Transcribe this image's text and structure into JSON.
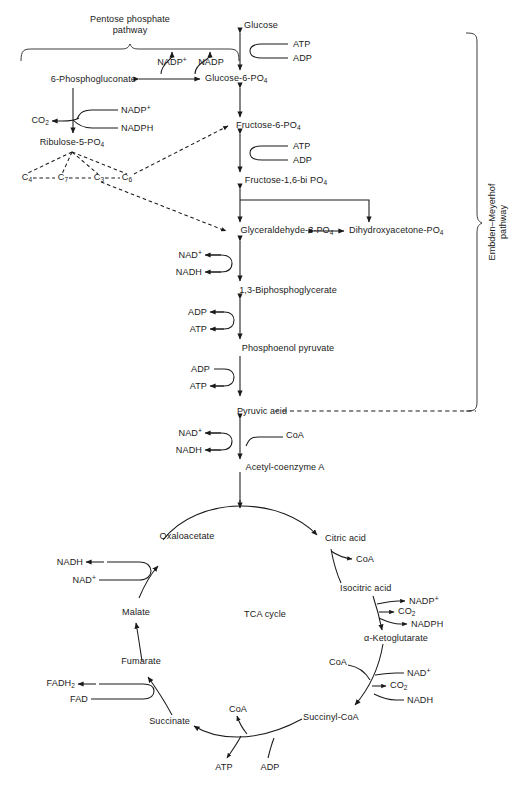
{
  "diagram": {
    "stroke_color": "#1a1a1a",
    "text_color": "#1a1a1a",
    "background": "#ffffff"
  },
  "section_labels": {
    "pentose_phosphate_line1": "Pentose phosphate",
    "pentose_phosphate_line2": "pathway",
    "embden_meyerhof_line1": "Embden–Meyerhof",
    "embden_meyerhof_line2": "pathway",
    "tca_cycle": "TCA cycle"
  },
  "glycolysis": {
    "metabolites": [
      {
        "id": "glucose",
        "label": "Glucose"
      },
      {
        "id": "glucose-6-po4",
        "label": "Glucose-6-PO",
        "sub": "4"
      },
      {
        "id": "fructose-6-po4",
        "label": "Fructose-6-PO",
        "sub": "4"
      },
      {
        "id": "fructose-16-bi-po4",
        "label": "Fructose-1,6-bi PO",
        "sub": "4"
      },
      {
        "id": "glyceraldehyde-3-po4",
        "label": "Glyceraldehyde-3-PO",
        "sub": "4"
      },
      {
        "id": "dihydroxyacetone-po4",
        "label": "Dihydroxyacetone-PO",
        "sub": "4"
      },
      {
        "id": "1-3-biphosphoglycerate",
        "label": "1,3-Biphosphoglycerate"
      },
      {
        "id": "phosphoenol-pyruvate",
        "label": "Phosphoenol pyruvate"
      },
      {
        "id": "pyruvic-acid",
        "label": "Pyruvic acid"
      },
      {
        "id": "acetyl-coenzyme-a",
        "label": "Acetyl-coenzyme A"
      }
    ],
    "cofactors": [
      {
        "id": "atp-hexokinase",
        "label": "ATP"
      },
      {
        "id": "adp-hexokinase",
        "label": "ADP"
      },
      {
        "id": "atp-pfk",
        "label": "ATP"
      },
      {
        "id": "adp-pfk",
        "label": "ADP"
      },
      {
        "id": "nad-plus-gapdh",
        "label": "NAD",
        "sup": "+"
      },
      {
        "id": "nadh-gapdh",
        "label": "NADH"
      },
      {
        "id": "adp-pgk",
        "label": "ADP"
      },
      {
        "id": "atp-pgk",
        "label": "ATP"
      },
      {
        "id": "adp-pk",
        "label": "ADP"
      },
      {
        "id": "atp-pk",
        "label": "ATP"
      },
      {
        "id": "nad-plus-pdh",
        "label": "NAD",
        "sup": "+"
      },
      {
        "id": "nadh-pdh",
        "label": "NADH"
      },
      {
        "id": "coa-pdh",
        "label": "CoA"
      }
    ]
  },
  "pentose_phosphate": {
    "metabolites": [
      {
        "id": "6-phosphogluconate",
        "label": "6-Phosphogluconate"
      },
      {
        "id": "ribulose-5-po4",
        "label": "Ribulose-5-PO",
        "sub": "4"
      },
      {
        "id": "co2-ppp",
        "label": "CO",
        "sub": "2"
      }
    ],
    "cofactors": [
      {
        "id": "nadp-plus-g6pdh",
        "label": "NADP",
        "sup": "+"
      },
      {
        "id": "nadp-g6pdh",
        "label": "NADP"
      },
      {
        "id": "nadp-plus-6pgdh",
        "label": "NADP",
        "sup": "+"
      },
      {
        "id": "nadph-6pgdh",
        "label": "NADPH"
      }
    ],
    "carbon_units": [
      {
        "id": "c4",
        "label": "C",
        "sub": "4"
      },
      {
        "id": "c7",
        "label": "C",
        "sub": "7"
      },
      {
        "id": "c3",
        "label": "C",
        "sub": "3"
      },
      {
        "id": "c6",
        "label": "C",
        "sub": "6"
      }
    ]
  },
  "tca": {
    "metabolites": [
      {
        "id": "oxaloacetate",
        "label": "Oxaloacetate"
      },
      {
        "id": "citric-acid",
        "label": "Citric acid"
      },
      {
        "id": "isocitric-acid",
        "label": "Isocitric acid"
      },
      {
        "id": "alpha-ketoglutarate",
        "label": "α-Ketoglutarate"
      },
      {
        "id": "succinyl-coa",
        "label": "Succinyl-CoA"
      },
      {
        "id": "succinate",
        "label": "Succinate"
      },
      {
        "id": "fumarate",
        "label": "Fumarate"
      },
      {
        "id": "malate",
        "label": "Malate"
      }
    ],
    "cofactors": [
      {
        "id": "nadh-mdh",
        "label": "NADH"
      },
      {
        "id": "nad-plus-mdh",
        "label": "NAD",
        "sup": "+"
      },
      {
        "id": "coa-citrate-synthase",
        "label": "CoA"
      },
      {
        "id": "nadp-plus-idh",
        "label": "NADP",
        "sup": "+"
      },
      {
        "id": "co2-idh",
        "label": "CO",
        "sub": "2"
      },
      {
        "id": "nadph-idh",
        "label": "NADPH"
      },
      {
        "id": "coa-kgdh",
        "label": "CoA"
      },
      {
        "id": "nad-plus-kgdh",
        "label": "NAD",
        "sup": "+"
      },
      {
        "id": "co2-kgdh",
        "label": "CO",
        "sub": "2"
      },
      {
        "id": "nadh-kgdh",
        "label": "NADH"
      },
      {
        "id": "coa-scs",
        "label": "CoA"
      },
      {
        "id": "atp-scs",
        "label": "ATP"
      },
      {
        "id": "adp-scs",
        "label": "ADP"
      },
      {
        "id": "fadh2-sdh",
        "label": "FADH",
        "sub": "2"
      },
      {
        "id": "fad-sdh",
        "label": "FAD"
      }
    ]
  }
}
